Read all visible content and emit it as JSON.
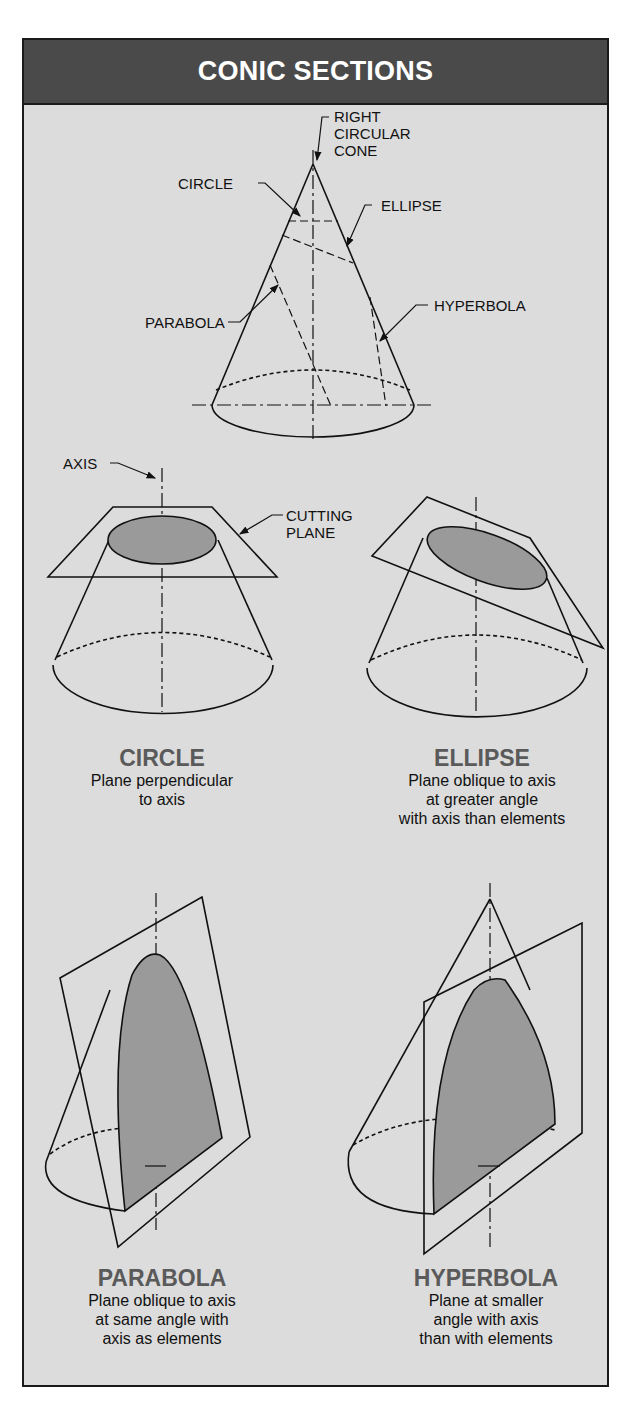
{
  "title": "CONIC SECTIONS",
  "colors": {
    "header_bg": "#4a4a4a",
    "panel_bg": "#dcdcdc",
    "section_fill": "#9a9a9a",
    "caption_title": "#5a5a5a"
  },
  "top_diagram": {
    "labels": {
      "cone": "RIGHT\nCIRCULAR\nCONE",
      "cone_lines": [
        "RIGHT",
        "CIRCULAR",
        "CONE"
      ],
      "circle": "CIRCLE",
      "ellipse": "ELLIPSE",
      "parabola": "PARABOLA",
      "hyperbola": "HYPERBOLA"
    }
  },
  "callouts": {
    "axis": "AXIS",
    "cutting_plane_lines": [
      "CUTTING",
      "PLANE"
    ]
  },
  "sections": [
    {
      "name": "CIRCLE",
      "description_lines": [
        "Plane perpendicular",
        "to axis"
      ]
    },
    {
      "name": "ELLIPSE",
      "description_lines": [
        "Plane oblique to axis",
        "at greater angle",
        "with axis than elements"
      ]
    },
    {
      "name": "PARABOLA",
      "description_lines": [
        "Plane oblique to axis",
        "at same angle with",
        "axis as elements"
      ]
    },
    {
      "name": "HYPERBOLA",
      "description_lines": [
        "Plane at smaller",
        "angle with axis",
        "than with elements"
      ]
    }
  ]
}
